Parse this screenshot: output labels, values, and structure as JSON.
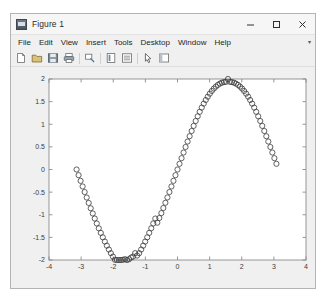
{
  "window": {
    "title": "Figure 1",
    "icon": "matlab-figure-icon",
    "controls": [
      "minimize-icon",
      "maximize-icon",
      "close-icon"
    ]
  },
  "menu": {
    "items": [
      "File",
      "Edit",
      "View",
      "Insert",
      "Tools",
      "Desktop",
      "Window",
      "Help"
    ],
    "overflow_glyph": "▾"
  },
  "toolbar": {
    "icons": [
      "new-figure-icon",
      "open-file-icon",
      "save-figure-icon",
      "print-figure-icon",
      "link-plot-icon",
      "insert-colorbar-icon",
      "insert-legend-icon",
      "pointer-arrow-icon",
      "show-plot-tools-icon"
    ]
  },
  "colors": {
    "window_background": "#f0f0f0",
    "titlebar_background": "#f6f6f6",
    "plot_background": "#ffffff",
    "axis_line": "#8c8c8c",
    "marker_stroke": "#3a3a3a",
    "tick_label": "#3c3c3c"
  },
  "chart_data": {
    "type": "scatter",
    "title": "",
    "xlabel": "",
    "ylabel": "",
    "xlim": [
      -4,
      4
    ],
    "ylim": [
      -2,
      2
    ],
    "xticks": [
      -4,
      -3,
      -2,
      -1,
      0,
      1,
      2,
      3,
      4
    ],
    "xticklabels": [
      "-4",
      "-3",
      "-2",
      "-1",
      "0",
      "1",
      "2",
      "3",
      "4"
    ],
    "yticks": [
      -2,
      -1.5,
      -1,
      -0.5,
      0,
      0.5,
      1,
      1.5,
      2
    ],
    "yticklabels": [
      "-2",
      "-1.5",
      "-1",
      "-0.5",
      "0",
      "0.5",
      "1",
      "1.5",
      "2"
    ],
    "grid": false,
    "legend": null,
    "box": true,
    "marker": "o",
    "marker_filled": false,
    "marker_size": 2.6,
    "series": [
      {
        "name": "2*sin(x)",
        "formula": "y = 2*sin(x)",
        "x": [
          -3.1416,
          -3.0788,
          -3.0159,
          -2.9531,
          -2.8903,
          -2.8274,
          -2.7646,
          -2.7018,
          -2.6389,
          -2.5761,
          -2.5133,
          -2.4504,
          -2.3876,
          -2.3248,
          -2.2619,
          -2.1991,
          -2.1363,
          -2.0735,
          -2.0106,
          -1.9478,
          -1.885,
          -1.8221,
          -1.7593,
          -1.6965,
          -1.6336,
          -1.5708,
          -1.508,
          -1.4451,
          -1.3823,
          -1.3195,
          -1.2566,
          -1.1938,
          -1.131,
          -1.0681,
          -1.0053,
          -0.9425,
          -0.8796,
          -0.8168,
          -0.754,
          -0.6912,
          -0.6283,
          -0.5655,
          -0.5027,
          -0.4398,
          -0.377,
          -0.3142,
          -0.2513,
          -0.1885,
          -0.1257,
          -0.0628,
          0.0,
          0.0628,
          0.1257,
          0.1885,
          0.2513,
          0.3142,
          0.377,
          0.4398,
          0.5027,
          0.5655,
          0.6283,
          0.6912,
          0.754,
          0.8168,
          0.8796,
          0.9425,
          1.0053,
          1.0681,
          1.131,
          1.1938,
          1.2566,
          1.3195,
          1.3823,
          1.4451,
          1.508,
          1.5708,
          1.6336,
          1.6965,
          1.7593,
          1.8221,
          1.885,
          1.9478,
          2.0106,
          2.0735,
          2.1363,
          2.1991,
          2.2619,
          2.3248,
          2.3876,
          2.4504,
          2.5133,
          2.5761,
          2.6389,
          2.7018,
          2.7646,
          2.8274,
          2.8903,
          2.9531,
          3.0159,
          3.0788
        ],
        "y": [
          0.0,
          -0.1256,
          -0.2507,
          -0.3749,
          -0.4979,
          -0.6194,
          -0.739,
          -0.8565,
          -0.9714,
          -1.0836,
          -1.1927,
          -1.2985,
          -1.4007,
          -1.499,
          -1.5932,
          -1.6831,
          -1.7684,
          -1.8489,
          -1.9244,
          -1.9947,
          -2.0,
          -2.0,
          -2.0,
          -1.9947,
          -1.9823,
          -2.0,
          -1.9823,
          -1.9458,
          -1.9244,
          -1.8489,
          -1.9021,
          -1.8489,
          -1.7684,
          -1.6831,
          -1.5932,
          -1.499,
          -1.4007,
          -1.2985,
          -1.1927,
          -1.0836,
          -1.1756,
          -1.0718,
          -0.9635,
          -0.8512,
          -0.7356,
          -0.618,
          -0.4972,
          -0.3747,
          -0.2507,
          -0.1256,
          0.0,
          0.1256,
          0.2507,
          0.3747,
          0.4972,
          0.618,
          0.7356,
          0.8512,
          0.9635,
          1.0718,
          1.1756,
          1.2748,
          1.368,
          1.455,
          1.5356,
          1.6094,
          1.6762,
          1.7357,
          1.7878,
          1.8322,
          1.869,
          1.8978,
          1.9187,
          1.9317,
          1.9367,
          2.0,
          1.9367,
          1.9317,
          1.9187,
          1.8978,
          1.869,
          1.8322,
          1.7878,
          1.7357,
          1.6762,
          1.6094,
          1.5356,
          1.455,
          1.368,
          1.2748,
          1.1756,
          1.0718,
          0.9635,
          0.8512,
          0.7356,
          0.618,
          0.4972,
          0.3747,
          0.2507,
          0.1256
        ]
      }
    ]
  }
}
